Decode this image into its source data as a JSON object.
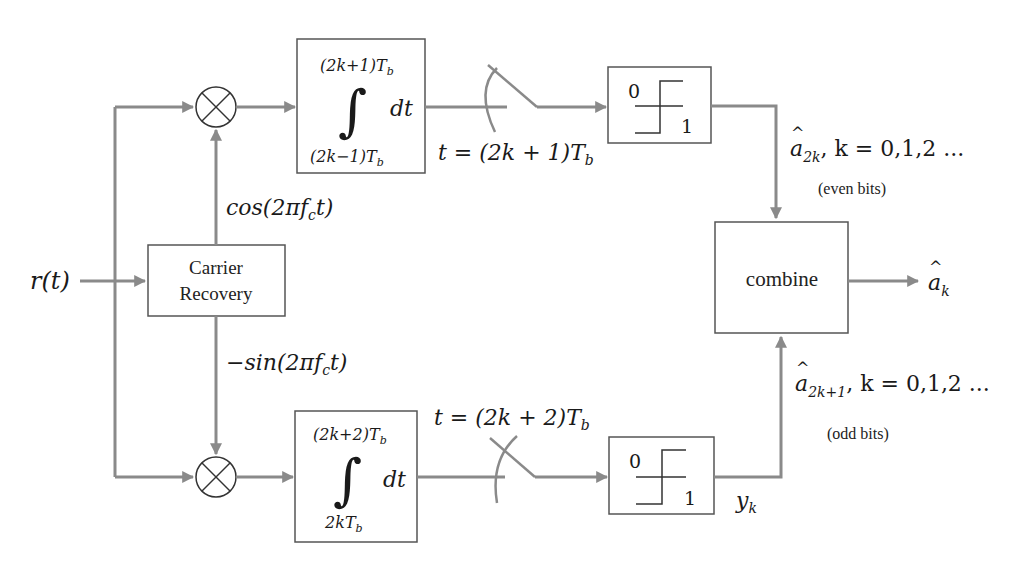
{
  "diagram": {
    "type": "block-diagram",
    "input": {
      "label": "r(t)"
    },
    "carrier_recovery": {
      "line1": "Carrier",
      "line2": "Recovery"
    },
    "top_branch": {
      "carrier_label": "cos(2πf",
      "carrier_sub": "c",
      "carrier_tail": "t)",
      "integrator": {
        "upper_limit": "(2k+1)T",
        "upper_sub": "b",
        "lower_limit": "(2k−1)T",
        "lower_sub": "b",
        "integral_symbol": "∫",
        "differential": "dt"
      },
      "sample_time": "t = (2k + 1)T",
      "sample_sub": "b",
      "decision": {
        "low": "0",
        "high": "1"
      },
      "output_label": "a",
      "output_hat": "^",
      "output_sub": "2k",
      "output_tail": ", k = 0,1,2 ...",
      "output_note": "(even bits)"
    },
    "bottom_branch": {
      "carrier_label": "−sin(2πf",
      "carrier_sub": "c",
      "carrier_tail": "t)",
      "integrator": {
        "upper_limit": "(2k+2)T",
        "upper_sub": "b",
        "lower_limit": "2kT",
        "lower_sub": "b",
        "integral_symbol": "∫",
        "differential": "dt"
      },
      "sample_time": "t = (2k + 2)T",
      "sample_sub": "b",
      "decision": {
        "low": "0",
        "high": "1"
      },
      "decision_output": "y",
      "decision_output_sub": "k",
      "output_label": "a",
      "output_hat": "^",
      "output_sub": "2k+1",
      "output_tail": ", k = 0,1,2 ...",
      "output_note": "(odd bits)"
    },
    "combiner": {
      "label": "combine"
    },
    "final_output": {
      "label": "a",
      "hat": "^",
      "sub": "k"
    },
    "colors": {
      "wire": "#8a8a8a",
      "box_border": "#555555",
      "text": "#1a1a1a",
      "background": "#ffffff"
    }
  }
}
